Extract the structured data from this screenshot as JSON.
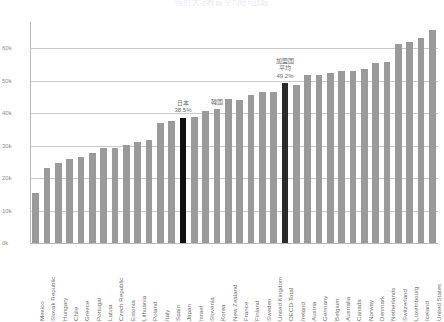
{
  "chart_title": "国別 大学教員 平均給与比較",
  "chart_data": {
    "type": "bar",
    "title": "国別 大学教員 平均給与比較",
    "xlabel": "",
    "ylabel": "",
    "ylim": [
      0,
      68000
    ],
    "grid": true,
    "legend": "none",
    "ytick_labels": [
      "0k",
      "10k",
      "20k",
      "30k",
      "40k",
      "50k",
      "60k"
    ],
    "ytick_values": [
      0,
      10000,
      20000,
      30000,
      40000,
      50000,
      60000
    ],
    "categories": [
      "Mexico",
      "Slovak Republic",
      "Hungary",
      "Chile",
      "Greece",
      "Portugal",
      "Latvia",
      "Czech Republic",
      "Estonia",
      "Lithuania",
      "Poland",
      "Italy",
      "Spain",
      "Japan",
      "Israel",
      "Slovenia",
      "Korea",
      "New Zealand",
      "France",
      "Finland",
      "Sweden",
      "United Kingdom",
      "OECD-Total",
      "Ireland",
      "Austria",
      "Germany",
      "Belgium",
      "Australia",
      "Canada",
      "Norway",
      "Denmark",
      "Netherlands",
      "Switzerland",
      "Luxembourg",
      "Iceland",
      "United States"
    ],
    "values": [
      15300,
      23100,
      24700,
      25900,
      26400,
      27800,
      29200,
      29200,
      30100,
      31000,
      31800,
      37000,
      37600,
      38500,
      38800,
      40700,
      41200,
      44200,
      44100,
      45400,
      46400,
      46500,
      49200,
      48700,
      51600,
      51700,
      52300,
      52900,
      52900,
      53400,
      55300,
      55600,
      61300,
      62000,
      63000,
      65400
    ],
    "highlighted": [
      {
        "category": "Japan",
        "color": "#111111"
      },
      {
        "category": "OECD-Total",
        "color": "#2b2b2b"
      }
    ],
    "annotations": [
      {
        "target": "Japan",
        "lines": [
          "日本",
          "38.5%"
        ],
        "value_label": "38.5%"
      },
      {
        "target": "Korea",
        "lines": [
          "韓国"
        ],
        "value_label": ""
      },
      {
        "target": "OECD-Total",
        "lines": [
          "加盟国",
          "平均",
          "49.2%"
        ],
        "value_label": "49.2%"
      }
    ]
  },
  "colors": {
    "bar": "#9a9a9a",
    "highlight": "#111111",
    "oecd": "#2b2b2b",
    "grid": "#c9c9c9",
    "axis": "#b9b9b9",
    "text": "#6f6f6f"
  }
}
